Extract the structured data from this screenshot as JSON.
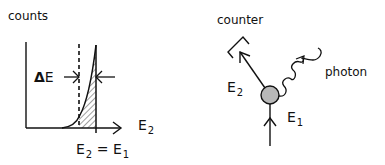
{
  "left_panel": {
    "y_axis_label": "counts",
    "delta_label_symbol": "Δ",
    "delta_label_var": "E",
    "x_axis_label_var": "E",
    "x_axis_label_sub": "2",
    "peak_label": {
      "lhs_var": "E",
      "lhs_sub": "2",
      "eq": "=",
      "rhs_var": "E",
      "rhs_sub": "1"
    }
  },
  "right_panel": {
    "counter_label": "counter",
    "photon_label": "photon",
    "outgoing_label_var": "E",
    "outgoing_label_sub": "2",
    "incoming_label_var": "E",
    "incoming_label_sub": "1"
  },
  "colors": {
    "ink": "#111111",
    "particle_fill": "#b8b8b8",
    "background": "#ffffff"
  }
}
